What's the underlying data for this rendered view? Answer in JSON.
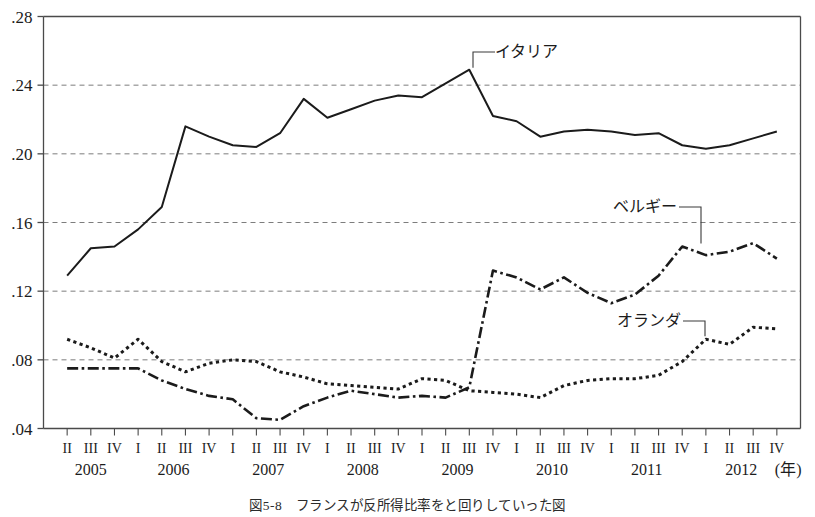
{
  "figure": {
    "caption": "図5-8　フランスが反所得比率をと回りしていった図"
  },
  "chart_data": {
    "type": "line",
    "title": "",
    "xlabel": "(年)",
    "ylabel": "",
    "ylim": [
      0.04,
      0.28
    ],
    "y_ticks": [
      ".04",
      ".08",
      ".12",
      ".16",
      ".20",
      ".24",
      ".28"
    ],
    "y_tick_values": [
      0.04,
      0.08,
      0.12,
      0.16,
      0.2,
      0.24,
      0.28
    ],
    "grid": true,
    "grid_style": "dashed-horizontal",
    "legend_position": "inline-annotations",
    "x_unit_note": "(年)",
    "x": [
      "2005 II",
      "2005 III",
      "2005 IV",
      "2006 I",
      "2006 II",
      "2006 III",
      "2006 IV",
      "2007 I",
      "2007 II",
      "2007 III",
      "2007 IV",
      "2008 I",
      "2008 II",
      "2008 III",
      "2008 IV",
      "2009 I",
      "2009 II",
      "2009 III",
      "2009 IV",
      "2010 I",
      "2010 II",
      "2010 III",
      "2010 IV",
      "2011 I",
      "2011 II",
      "2011 III",
      "2011 IV",
      "2012 I",
      "2012 II",
      "2012 III",
      "2012 IV"
    ],
    "quarter_labels": [
      "II",
      "III",
      "IV",
      "I",
      "II",
      "III",
      "IV",
      "I",
      "II",
      "III",
      "IV",
      "I",
      "II",
      "III",
      "IV",
      "I",
      "II",
      "III",
      "IV",
      "I",
      "II",
      "III",
      "IV",
      "I",
      "II",
      "III",
      "IV",
      "I",
      "II",
      "III",
      "IV"
    ],
    "year_groups": [
      {
        "year": "2005",
        "start_index": 0,
        "count": 3
      },
      {
        "year": "2006",
        "start_index": 3,
        "count": 4
      },
      {
        "year": "2007",
        "start_index": 7,
        "count": 4
      },
      {
        "year": "2008",
        "start_index": 11,
        "count": 4
      },
      {
        "year": "2009",
        "start_index": 15,
        "count": 4
      },
      {
        "year": "2010",
        "start_index": 19,
        "count": 4
      },
      {
        "year": "2011",
        "start_index": 23,
        "count": 4
      },
      {
        "year": "2012",
        "start_index": 27,
        "count": 4
      }
    ],
    "series": [
      {
        "name": "イタリア",
        "style": "solid",
        "color": "#1b1b1b",
        "values": [
          0.129,
          0.145,
          0.146,
          0.156,
          0.169,
          0.216,
          0.21,
          0.205,
          0.204,
          0.212,
          0.232,
          0.221,
          0.226,
          0.231,
          0.234,
          0.233,
          0.241,
          0.249,
          0.222,
          0.219,
          0.21,
          0.213,
          0.214,
          0.213,
          0.211,
          0.212,
          0.205,
          0.203,
          0.205,
          0.209,
          0.213
        ]
      },
      {
        "name": "ベルギー",
        "style": "dash-dot",
        "color": "#1b1b1b",
        "values": [
          0.075,
          0.075,
          0.075,
          0.075,
          0.068,
          0.063,
          0.059,
          0.057,
          0.046,
          0.045,
          0.053,
          0.058,
          0.062,
          0.06,
          0.058,
          0.059,
          0.058,
          0.064,
          0.132,
          0.128,
          0.121,
          0.128,
          0.119,
          0.113,
          0.118,
          0.129,
          0.146,
          0.141,
          0.143,
          0.148,
          0.139
        ]
      },
      {
        "name": "オランダ",
        "style": "dotted",
        "color": "#1b1b1b",
        "values": [
          0.092,
          0.087,
          0.081,
          0.092,
          0.079,
          0.073,
          0.078,
          0.08,
          0.079,
          0.073,
          0.07,
          0.066,
          0.065,
          0.064,
          0.063,
          0.069,
          0.068,
          0.062,
          0.061,
          0.06,
          0.058,
          0.065,
          0.068,
          0.069,
          0.069,
          0.071,
          0.079,
          0.092,
          0.089,
          0.099,
          0.098
        ]
      }
    ],
    "annotations": [
      {
        "label": "イタリア",
        "anchor_index": 17,
        "label_x": 495,
        "label_y": 57
      },
      {
        "label": "ベルギー",
        "anchor_index": 26,
        "label_x": 613,
        "label_y": 212
      },
      {
        "label": "オランダ",
        "anchor_index": 27,
        "label_x": 617,
        "label_y": 326
      }
    ]
  }
}
